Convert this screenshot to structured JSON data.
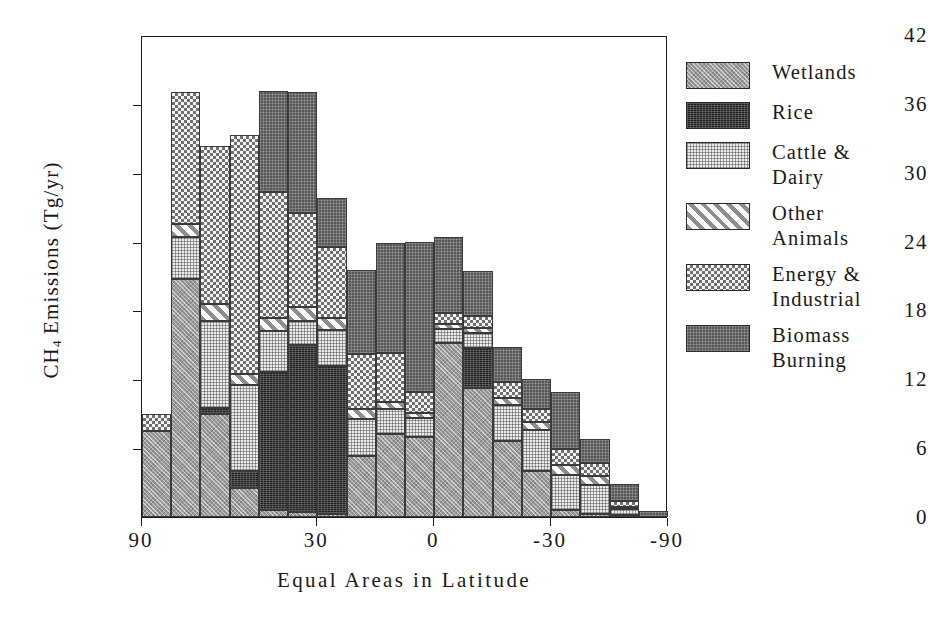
{
  "chart_data": {
    "type": "bar",
    "stacked": true,
    "title": "",
    "xlabel": "Equal Areas in Latitude",
    "ylabel": "CH4 Emissions (Tg/yr)",
    "ylabel_parts": {
      "prefix": "CH",
      "sub": "4",
      "suffix": " Emissions (Tg/yr)"
    },
    "ylim": [
      0,
      42
    ],
    "yticks": [
      0,
      6,
      12,
      18,
      24,
      30,
      36,
      42
    ],
    "ytick_labels": [
      "0",
      "6",
      "12",
      "18",
      "24",
      "30",
      "36",
      "42"
    ],
    "xtick_labels": [
      "90",
      "30",
      "0",
      "-30",
      "-90"
    ],
    "xtick_positions": [
      0,
      6,
      10,
      14,
      18
    ],
    "grid": false,
    "legend_position": "right",
    "n_bins": 18,
    "series": [
      {
        "name": "Wetlands",
        "key": "wetlands",
        "swatch": "wetlands-swatch",
        "values": [
          7.5,
          20.7,
          9.0,
          2.5,
          0.6,
          0.4,
          0.3,
          5.3,
          7.2,
          7.0,
          15.2,
          11.2,
          6.6,
          4.0,
          0.6,
          0.3,
          0.2,
          0.0
        ]
      },
      {
        "name": "Rice",
        "key": "rice",
        "swatch": "rice-swatch",
        "values": [
          0.0,
          0.0,
          0.5,
          1.5,
          12.0,
          14.6,
          12.9,
          0.0,
          0.0,
          0.0,
          0.0,
          3.5,
          0.0,
          0.0,
          0.0,
          0.0,
          0.0,
          0.0
        ]
      },
      {
        "name": "Cattle & Dairy",
        "key": "cattle",
        "swatch": "cattle-swatch",
        "values": [
          0.0,
          3.7,
          7.6,
          7.5,
          3.6,
          2.1,
          3.1,
          3.2,
          2.2,
          1.6,
          1.2,
          1.3,
          3.2,
          3.6,
          3.1,
          2.5,
          0.5,
          0.0
        ]
      },
      {
        "name": "Other Animals",
        "key": "other",
        "swatch": "other-animals-swatch",
        "values": [
          0.0,
          1.1,
          1.5,
          1.0,
          1.1,
          1.2,
          1.0,
          0.9,
          0.6,
          0.5,
          0.4,
          0.5,
          0.6,
          0.7,
          0.8,
          0.8,
          0.2,
          0.0
        ]
      },
      {
        "name": "Energy & Industrial",
        "key": "energy",
        "swatch": "energy-swatch",
        "values": [
          1.5,
          11.5,
          13.7,
          20.8,
          11.0,
          8.2,
          6.2,
          4.8,
          4.3,
          1.8,
          1.0,
          1.0,
          1.4,
          1.1,
          1.4,
          1.1,
          0.5,
          0.0
        ]
      },
      {
        "name": "Biomass Burning",
        "key": "biomass",
        "swatch": "biomass-swatch",
        "values": [
          0.0,
          0.0,
          0.0,
          0.0,
          8.8,
          10.5,
          4.3,
          7.3,
          9.6,
          13.1,
          6.6,
          3.9,
          3.0,
          2.6,
          5.0,
          2.1,
          1.5,
          0.5
        ]
      }
    ],
    "bin_totals": [
      9.0,
      37.0,
      32.3,
      33.3,
      37.1,
      37.0,
      27.8,
      21.5,
      23.9,
      24.0,
      24.4,
      21.4,
      14.8,
      12.0,
      10.9,
      6.8,
      2.9,
      0.5
    ]
  },
  "legend": {
    "items": [
      {
        "label": "Wetlands",
        "swatch": "wetlands-swatch"
      },
      {
        "label": "Rice",
        "swatch": "rice-swatch"
      },
      {
        "label": "Cattle &\nDairy",
        "swatch": "cattle-swatch"
      },
      {
        "label": "Other\nAnimals",
        "swatch": "other-animals-swatch"
      },
      {
        "label": "Energy &\nIndustrial",
        "swatch": "energy-swatch"
      },
      {
        "label": "Biomass\nBurning",
        "swatch": "biomass-swatch"
      }
    ]
  },
  "colors": {
    "axis": "#1a1a1a",
    "background": "#ffffff",
    "wetlands": "#9a9a9a",
    "rice": "#201f1f",
    "cattle": "#ececec",
    "other": "#ffffff",
    "energy": "#6f6f6f",
    "biomass": "#575757"
  }
}
